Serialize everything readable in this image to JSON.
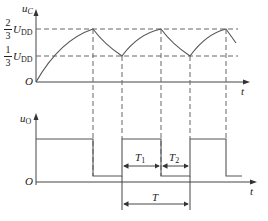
{
  "top_chart": {
    "y_axis_label": "u",
    "y_axis_sub": "C",
    "origin_label": "O",
    "x_axis_label": "t",
    "levels": [
      {
        "frac_num": "2",
        "frac_den": "3",
        "symbol": "U",
        "symbol_sub": "DD"
      },
      {
        "frac_num": "1",
        "frac_den": "3",
        "symbol": "U",
        "symbol_sub": "DD"
      }
    ]
  },
  "bottom_chart": {
    "y_axis_label": "u",
    "y_axis_sub": "O",
    "origin_label": "O",
    "x_axis_label": "t",
    "intervals": [
      {
        "label": "T",
        "sub": "1"
      },
      {
        "label": "T",
        "sub": "2"
      },
      {
        "label": "T",
        "sub": ""
      }
    ]
  },
  "colors": {
    "line": "#555555",
    "dash": "#666666",
    "text": "#222222"
  }
}
